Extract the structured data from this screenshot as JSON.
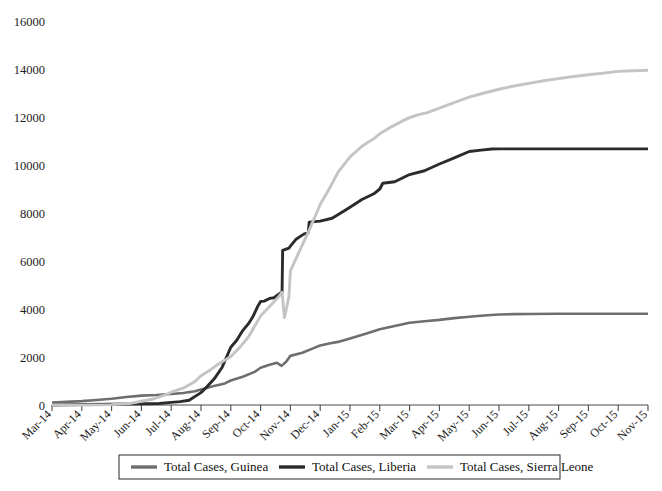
{
  "chart_data": {
    "type": "line",
    "title": "",
    "subtitle": "",
    "xlabel": "",
    "ylabel": "",
    "ylim": [
      0,
      16000
    ],
    "ytick_step": 2000,
    "yticks": [
      "0",
      "2000",
      "4000",
      "6000",
      "8000",
      "10000",
      "12000",
      "14000",
      "16000"
    ],
    "ytick_values": [
      0,
      2000,
      4000,
      6000,
      8000,
      10000,
      12000,
      14000,
      16000
    ],
    "grid": false,
    "legend_position": "bottom",
    "categories": [
      "Mar-14",
      "Apr-14",
      "May-14",
      "Jun-14",
      "Jul-14",
      "Aug-14",
      "Sep-14",
      "Oct-14",
      "Nov-14",
      "Dec-14",
      "Jan-15",
      "Feb-15",
      "Mar-15",
      "Apr-15",
      "May-15",
      "Jun-15",
      "Jul-15",
      "Aug-15",
      "Sep-15",
      "Oct-15",
      "Nov-15"
    ],
    "series": [
      {
        "name": "Total Cases, Guinea",
        "color": "#6e6e6e",
        "width": 2.6,
        "values": [
          103,
          160,
          258,
          390,
          460,
          648,
          1022,
          1553,
          2047,
          2707,
          2917,
          3155,
          3429,
          3548,
          3674,
          3760,
          3786,
          3792,
          3800,
          3804,
          3804
        ],
        "detail_points": [
          {
            "x": 0.0,
            "y": 103
          },
          {
            "x": 0.5,
            "y": 130
          },
          {
            "x": 1.0,
            "y": 160
          },
          {
            "x": 1.5,
            "y": 210
          },
          {
            "x": 2.0,
            "y": 258
          },
          {
            "x": 2.5,
            "y": 330
          },
          {
            "x": 3.0,
            "y": 390
          },
          {
            "x": 3.5,
            "y": 415
          },
          {
            "x": 4.0,
            "y": 460
          },
          {
            "x": 4.4,
            "y": 500
          },
          {
            "x": 4.8,
            "y": 570
          },
          {
            "x": 5.0,
            "y": 648
          },
          {
            "x": 5.4,
            "y": 780
          },
          {
            "x": 5.8,
            "y": 900
          },
          {
            "x": 6.0,
            "y": 1022
          },
          {
            "x": 6.4,
            "y": 1180
          },
          {
            "x": 6.8,
            "y": 1380
          },
          {
            "x": 7.0,
            "y": 1553
          },
          {
            "x": 7.3,
            "y": 1680
          },
          {
            "x": 7.55,
            "y": 1760
          },
          {
            "x": 7.7,
            "y": 1630
          },
          {
            "x": 7.85,
            "y": 1790
          },
          {
            "x": 8.0,
            "y": 2047
          },
          {
            "x": 8.4,
            "y": 2180
          },
          {
            "x": 8.8,
            "y": 2380
          },
          {
            "x": 9.0,
            "y": 2480
          },
          {
            "x": 9.3,
            "y": 2560
          },
          {
            "x": 9.6,
            "y": 2630
          },
          {
            "x": 10.0,
            "y": 2775
          },
          {
            "x": 10.5,
            "y": 2960
          },
          {
            "x": 11.0,
            "y": 3155
          },
          {
            "x": 11.5,
            "y": 3290
          },
          {
            "x": 12.0,
            "y": 3429
          },
          {
            "x": 12.5,
            "y": 3490
          },
          {
            "x": 13.0,
            "y": 3548
          },
          {
            "x": 13.5,
            "y": 3620
          },
          {
            "x": 14.0,
            "y": 3674
          },
          {
            "x": 14.5,
            "y": 3730
          },
          {
            "x": 15.0,
            "y": 3768
          },
          {
            "x": 15.5,
            "y": 3786
          },
          {
            "x": 16.0,
            "y": 3792
          },
          {
            "x": 17.0,
            "y": 3800
          },
          {
            "x": 18.0,
            "y": 3802
          },
          {
            "x": 19.0,
            "y": 3804
          },
          {
            "x": 20.0,
            "y": 3804
          }
        ]
      },
      {
        "name": "Total Cases, Liberia",
        "color": "#2b2b2b",
        "width": 2.9,
        "values": [
          0,
          21,
          34,
          51,
          107,
          516,
          2407,
          4665,
          7168,
          7862,
          8622,
          9238,
          9602,
          10042,
          10564,
          10666,
          10672,
          10672,
          10672,
          10672,
          10672
        ],
        "detail_points": [
          {
            "x": 0.0,
            "y": 0
          },
          {
            "x": 1.0,
            "y": 21
          },
          {
            "x": 2.0,
            "y": 34
          },
          {
            "x": 3.0,
            "y": 51
          },
          {
            "x": 3.6,
            "y": 60
          },
          {
            "x": 4.0,
            "y": 107
          },
          {
            "x": 4.3,
            "y": 140
          },
          {
            "x": 4.6,
            "y": 200
          },
          {
            "x": 5.0,
            "y": 516
          },
          {
            "x": 5.2,
            "y": 760
          },
          {
            "x": 5.45,
            "y": 1100
          },
          {
            "x": 5.7,
            "y": 1550
          },
          {
            "x": 6.0,
            "y": 2407
          },
          {
            "x": 6.2,
            "y": 2700
          },
          {
            "x": 6.4,
            "y": 3100
          },
          {
            "x": 6.6,
            "y": 3400
          },
          {
            "x": 6.75,
            "y": 3700
          },
          {
            "x": 6.9,
            "y": 4100
          },
          {
            "x": 7.0,
            "y": 4310
          },
          {
            "x": 7.12,
            "y": 4330
          },
          {
            "x": 7.3,
            "y": 4440
          },
          {
            "x": 7.45,
            "y": 4470
          },
          {
            "x": 7.6,
            "y": 4610
          },
          {
            "x": 7.72,
            "y": 4700
          },
          {
            "x": 7.74,
            "y": 6440
          },
          {
            "x": 7.95,
            "y": 6540
          },
          {
            "x": 8.0,
            "y": 6620
          },
          {
            "x": 8.2,
            "y": 6920
          },
          {
            "x": 8.45,
            "y": 7120
          },
          {
            "x": 8.6,
            "y": 7180
          },
          {
            "x": 8.63,
            "y": 7620
          },
          {
            "x": 9.0,
            "y": 7660
          },
          {
            "x": 9.4,
            "y": 7780
          },
          {
            "x": 9.8,
            "y": 8080
          },
          {
            "x": 10.0,
            "y": 8240
          },
          {
            "x": 10.4,
            "y": 8560
          },
          {
            "x": 10.8,
            "y": 8800
          },
          {
            "x": 11.0,
            "y": 9000
          },
          {
            "x": 11.1,
            "y": 9240
          },
          {
            "x": 11.5,
            "y": 9300
          },
          {
            "x": 12.0,
            "y": 9602
          },
          {
            "x": 12.5,
            "y": 9760
          },
          {
            "x": 13.0,
            "y": 10042
          },
          {
            "x": 13.5,
            "y": 10300
          },
          {
            "x": 14.0,
            "y": 10564
          },
          {
            "x": 14.4,
            "y": 10620
          },
          {
            "x": 14.75,
            "y": 10666
          },
          {
            "x": 15.0,
            "y": 10672
          },
          {
            "x": 16.0,
            "y": 10672
          },
          {
            "x": 17.0,
            "y": 10672
          },
          {
            "x": 18.0,
            "y": 10672
          },
          {
            "x": 19.0,
            "y": 10672
          },
          {
            "x": 20.0,
            "y": 10672
          }
        ]
      },
      {
        "name": "Total Cases, Sierra Leone",
        "color": "#c4c4c4",
        "width": 2.9,
        "values": [
          0,
          0,
          16,
          158,
          533,
          1216,
          2021,
          3706,
          5586,
          8356,
          10340,
          11301,
          11974,
          12371,
          12827,
          13155,
          13400,
          13600,
          13760,
          13900,
          13945
        ],
        "detail_points": [
          {
            "x": 0.0,
            "y": 0
          },
          {
            "x": 1.0,
            "y": 0
          },
          {
            "x": 2.0,
            "y": 16
          },
          {
            "x": 2.6,
            "y": 60
          },
          {
            "x": 3.0,
            "y": 158
          },
          {
            "x": 3.4,
            "y": 250
          },
          {
            "x": 3.8,
            "y": 420
          },
          {
            "x": 4.0,
            "y": 533
          },
          {
            "x": 4.4,
            "y": 700
          },
          {
            "x": 4.8,
            "y": 980
          },
          {
            "x": 5.0,
            "y": 1216
          },
          {
            "x": 5.3,
            "y": 1450
          },
          {
            "x": 5.6,
            "y": 1720
          },
          {
            "x": 6.0,
            "y": 2021
          },
          {
            "x": 6.3,
            "y": 2400
          },
          {
            "x": 6.6,
            "y": 2850
          },
          {
            "x": 7.0,
            "y": 3706
          },
          {
            "x": 7.3,
            "y": 4100
          },
          {
            "x": 7.6,
            "y": 4500
          },
          {
            "x": 7.72,
            "y": 4700
          },
          {
            "x": 7.8,
            "y": 3640
          },
          {
            "x": 7.95,
            "y": 4500
          },
          {
            "x": 8.0,
            "y": 5586
          },
          {
            "x": 8.3,
            "y": 6400
          },
          {
            "x": 8.6,
            "y": 7200
          },
          {
            "x": 9.0,
            "y": 8356
          },
          {
            "x": 9.3,
            "y": 9000
          },
          {
            "x": 9.6,
            "y": 9700
          },
          {
            "x": 10.0,
            "y": 10340
          },
          {
            "x": 10.4,
            "y": 10780
          },
          {
            "x": 10.8,
            "y": 11100
          },
          {
            "x": 11.0,
            "y": 11301
          },
          {
            "x": 11.4,
            "y": 11600
          },
          {
            "x": 11.8,
            "y": 11860
          },
          {
            "x": 12.0,
            "y": 11974
          },
          {
            "x": 12.3,
            "y": 12100
          },
          {
            "x": 12.6,
            "y": 12180
          },
          {
            "x": 13.0,
            "y": 12371
          },
          {
            "x": 13.4,
            "y": 12560
          },
          {
            "x": 13.8,
            "y": 12740
          },
          {
            "x": 14.0,
            "y": 12827
          },
          {
            "x": 14.5,
            "y": 13000
          },
          {
            "x": 15.0,
            "y": 13155
          },
          {
            "x": 15.5,
            "y": 13290
          },
          {
            "x": 16.0,
            "y": 13400
          },
          {
            "x": 16.5,
            "y": 13510
          },
          {
            "x": 17.0,
            "y": 13600
          },
          {
            "x": 17.5,
            "y": 13690
          },
          {
            "x": 18.0,
            "y": 13760
          },
          {
            "x": 18.5,
            "y": 13830
          },
          {
            "x": 19.0,
            "y": 13900
          },
          {
            "x": 19.5,
            "y": 13930
          },
          {
            "x": 20.0,
            "y": 13945
          }
        ]
      }
    ],
    "legend": [
      {
        "label": "Total Cases, Guinea",
        "color": "#6e6e6e"
      },
      {
        "label": "Total Cases, Liberia",
        "color": "#2b2b2b"
      },
      {
        "label": "Total Cases, Sierra Leone",
        "color": "#c4c4c4"
      }
    ]
  }
}
